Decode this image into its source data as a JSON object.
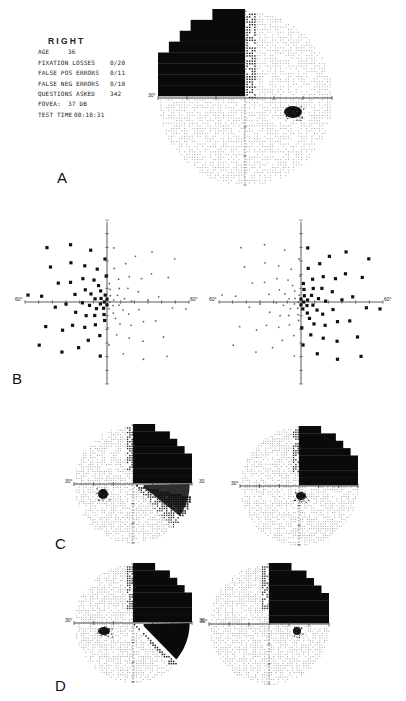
{
  "panels": {
    "A": {
      "letter": "A",
      "eye": "RIGHT"
    },
    "B": {
      "letter": "B"
    },
    "C": {
      "letter": "C"
    },
    "D": {
      "letter": "D"
    }
  },
  "test_info": {
    "eye": "RIGHT",
    "rows": [
      {
        "key": "AGE",
        "value": "36"
      },
      {
        "key": "FIXATION LOSSES",
        "value": "0/20"
      },
      {
        "key": "FALSE POS ERRORS",
        "value": "0/11"
      },
      {
        "key": "FALSE NEG ERRORS",
        "value": "0/10"
      },
      {
        "key": "QUESTIONS ASKED",
        "value": "342"
      },
      {
        "key": "FOVEA:",
        "value": "37 DB"
      },
      {
        "key": "TEST TIME",
        "value": "00:10:31"
      }
    ]
  },
  "axis_labels": {
    "A_left": "30°",
    "B_left_left": "60°",
    "B_left_right": "60°",
    "B_right_left": "60°",
    "B_right_right": "60°",
    "C_left_left": "30°",
    "C_left_right": "30",
    "C_right_left": "30°",
    "D_left_left": "30°",
    "D_left_right": "30",
    "D_right_left": "30°"
  },
  "colors": {
    "defect": "#0a0a0a",
    "grid_dots": "#9a9a9a",
    "axis": "#333333",
    "background": "#ffffff"
  },
  "chart_data": [
    {
      "type": "heatmap",
      "title": "Panel A — Right eye 30° greyscale visual field",
      "xlabel": "",
      "ylabel": "",
      "axis_range_deg": [
        -30,
        30
      ],
      "description": "Dense black defect filling superior-temporal (upper-left) quadrant with stair-stepped border; physiological blind spot below horizontal in right half",
      "defect_quadrants": [
        "superior-left"
      ],
      "blind_spot": {
        "x_deg": 15,
        "y_deg": -3
      }
    },
    {
      "type": "scatter",
      "title": "Panel B — Peripheral 60° fields (left and right plots)",
      "axis_range_deg": [
        -60,
        60
      ],
      "legend": [
        "seen (small dot)",
        "not seen (filled square)"
      ],
      "plots": [
        {
          "name": "left",
          "missed_side": "left hemifield"
        },
        {
          "name": "right",
          "missed_side": "right hemifield"
        }
      ]
    },
    {
      "type": "heatmap",
      "title": "Panel C — 30° greyscale fields (two eyes)",
      "axis_range_deg": [
        -30,
        30
      ],
      "plots": [
        {
          "name": "left",
          "defect": "superior-right quadrant dense + inferior-right partial wedge"
        },
        {
          "name": "right",
          "defect": "superior-right quadrant dense, fading toward horizontal"
        }
      ]
    },
    {
      "type": "heatmap",
      "title": "Panel D — 30° greyscale fields (two eyes)",
      "axis_range_deg": [
        -30,
        30
      ],
      "plots": [
        {
          "name": "left",
          "defect": "superior-right quadrant dense + inferior-right sharp wedge"
        },
        {
          "name": "right",
          "defect": "superior-right quadrant dense, fading toward horizontal"
        }
      ]
    }
  ]
}
